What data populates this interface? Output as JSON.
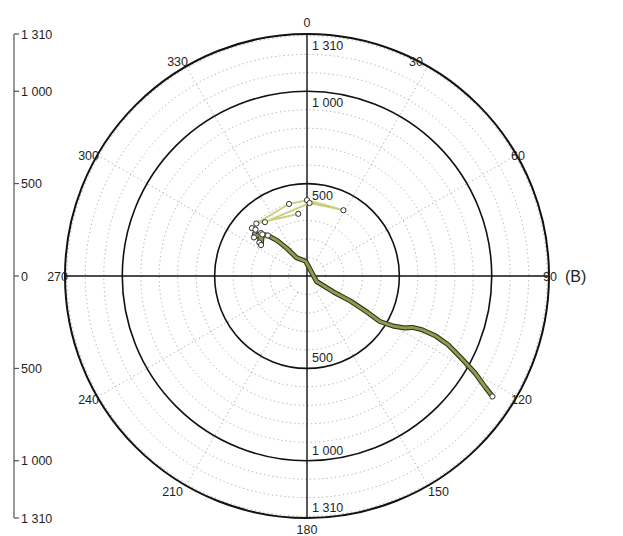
{
  "chart_data": {
    "type": "scatter",
    "subtype": "polar-trajectory",
    "title_visible_fragment": "",
    "panel_label": "(B)",
    "angular_axis": {
      "direction": "clockwise",
      "zero_location": "north",
      "ticks": [
        0,
        30,
        60,
        90,
        120,
        150,
        180,
        210,
        240,
        270,
        300,
        330
      ],
      "tick_labels": [
        "0",
        "30",
        "60",
        "90",
        "120",
        "150",
        "180",
        "210",
        "240",
        "270",
        "300",
        "330"
      ]
    },
    "radial_axis": {
      "range": [
        0,
        1310
      ],
      "major_rings": [
        500,
        1000,
        1310
      ],
      "minor_ring_step": 100,
      "tick_labels_top": [
        "500",
        "1 000",
        "1 310"
      ],
      "tick_labels_bottom": [
        "500",
        "1 000",
        "1 310"
      ],
      "grid": "dotted"
    },
    "linear_axis_left": {
      "ticks": [
        1310,
        1000,
        500,
        0,
        500,
        1000,
        1310
      ],
      "tick_labels": [
        "1 310",
        "1 000",
        "500",
        "0",
        "500",
        "1 000",
        "1 310"
      ]
    },
    "series": [
      {
        "name": "initial-loop",
        "color": "#c9cf7a",
        "marker": "open-circle",
        "points_polar": [
          {
            "angle": 352,
            "r": 340
          },
          {
            "angle": 316,
            "r": 395
          },
          {
            "angle": 346,
            "r": 402
          },
          {
            "angle": 0,
            "r": 411
          },
          {
            "angle": 29,
            "r": 407
          },
          {
            "angle": 2,
            "r": 395
          },
          {
            "angle": 322,
            "r": 370
          }
        ]
      },
      {
        "name": "main-trajectory",
        "color": "#8f9a4a",
        "outline": "#2a2a1a",
        "marker": "open-circle",
        "points_polar": [
          {
            "angle": 311,
            "r": 395
          },
          {
            "angle": 312,
            "r": 375
          },
          {
            "angle": 306,
            "r": 355
          },
          {
            "angle": 313,
            "r": 340
          },
          {
            "angle": 305,
            "r": 315
          },
          {
            "angle": 304,
            "r": 300
          },
          {
            "angle": 313,
            "r": 330
          },
          {
            "angle": 316,
            "r": 305
          },
          {
            "angle": 320,
            "r": 250
          },
          {
            "angle": 324,
            "r": 185
          },
          {
            "angle": 330,
            "r": 115
          },
          {
            "angle": 355,
            "r": 80
          },
          {
            "angle": 120,
            "r": 60
          },
          {
            "angle": 121,
            "r": 170
          },
          {
            "angle": 120,
            "r": 270
          },
          {
            "angle": 121,
            "r": 380
          },
          {
            "angle": 122,
            "r": 465
          },
          {
            "angle": 120,
            "r": 545
          },
          {
            "angle": 118,
            "r": 600
          },
          {
            "angle": 116,
            "r": 635
          },
          {
            "angle": 115,
            "r": 690
          },
          {
            "angle": 115,
            "r": 770
          },
          {
            "angle": 116,
            "r": 850
          },
          {
            "angle": 118,
            "r": 945
          },
          {
            "angle": 120,
            "r": 1050
          },
          {
            "angle": 122,
            "r": 1140
          },
          {
            "angle": 123,
            "r": 1197
          }
        ]
      }
    ]
  },
  "labels": {
    "panel": "(B)",
    "angles": [
      "0",
      "30",
      "60",
      "90",
      "120",
      "150",
      "180",
      "210",
      "240",
      "270",
      "300",
      "330"
    ],
    "radial_top": [
      "1 310",
      "1 000",
      "500"
    ],
    "radial_bottom": [
      "500",
      "1 000",
      "1 310"
    ],
    "left_axis": [
      "1 310",
      "1 000",
      "500",
      "0",
      "500",
      "1 000",
      "1 310"
    ]
  },
  "colors": {
    "axis": "#111111",
    "grid": "#a8a8a8",
    "loop": "#d0d58a",
    "trajectory": "#8c9648",
    "trajectory_outline": "#2b2b1c"
  }
}
